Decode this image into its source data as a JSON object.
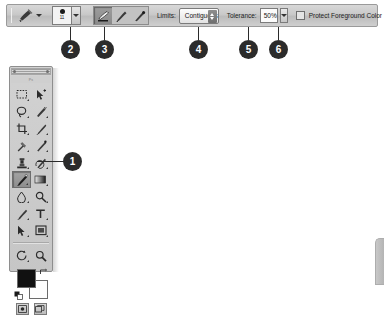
{
  "options_bar": {
    "tool_preset": {
      "icon": "brush-tool-icon",
      "dropdown": "chevron-down-icon"
    },
    "brush": {
      "size_label": "11",
      "icon": "brush-tip-preview-icon",
      "popup": "chevron-down-icon"
    },
    "sampling_modes": [
      {
        "name": "sampling-continuous",
        "icon": "sampling-continuous-icon",
        "selected": true
      },
      {
        "name": "sampling-once",
        "icon": "sampling-once-icon",
        "selected": false
      },
      {
        "name": "sampling-background-swatch",
        "icon": "sampling-background-swatch-icon",
        "selected": false
      }
    ],
    "limits": {
      "label": "Limits:",
      "value": "Contiguous"
    },
    "tolerance": {
      "label": "Tolerance:",
      "value": "50%"
    },
    "protect_foreground": {
      "label": "Protect Foreground Color",
      "checked": false
    },
    "end_icon": "brush-preset-icon"
  },
  "toolbox": {
    "title": "",
    "logo_text": "Ps",
    "tools": [
      {
        "name": "rectangular-marquee-tool",
        "icon": "marquee-icon",
        "has_flyout": true,
        "selected": false
      },
      {
        "name": "move-tool",
        "icon": "move-arrow-icon",
        "has_flyout": false,
        "selected": false
      },
      {
        "name": "lasso-tool",
        "icon": "lasso-icon",
        "has_flyout": true,
        "selected": false
      },
      {
        "name": "quick-selection-tool",
        "icon": "quick-selection-icon",
        "has_flyout": true,
        "selected": false
      },
      {
        "name": "crop-tool",
        "icon": "crop-icon",
        "has_flyout": true,
        "selected": false
      },
      {
        "name": "slice-tool",
        "icon": "slice-knife-icon",
        "has_flyout": true,
        "selected": false
      },
      {
        "name": "eyedropper-tool",
        "icon": "eyedropper-icon",
        "has_flyout": true,
        "selected": false
      },
      {
        "name": "healing-brush-tool",
        "icon": "healing-brush-icon",
        "has_flyout": true,
        "selected": false
      },
      {
        "name": "clone-stamp-tool",
        "icon": "clone-stamp-icon",
        "has_flyout": true,
        "selected": false
      },
      {
        "name": "history-brush-tool",
        "icon": "history-brush-icon",
        "has_flyout": true,
        "selected": false
      },
      {
        "name": "background-eraser-tool",
        "icon": "background-eraser-icon",
        "has_flyout": true,
        "selected": true
      },
      {
        "name": "gradient-tool",
        "icon": "gradient-icon",
        "has_flyout": true,
        "selected": false
      },
      {
        "name": "blur-tool",
        "icon": "blur-droplet-icon",
        "has_flyout": true,
        "selected": false
      },
      {
        "name": "dodge-tool",
        "icon": "dodge-icon",
        "has_flyout": true,
        "selected": false
      },
      {
        "name": "pen-tool",
        "icon": "pen-icon",
        "has_flyout": true,
        "selected": false
      },
      {
        "name": "horizontal-type-tool",
        "icon": "type-t-icon",
        "has_flyout": true,
        "selected": false
      },
      {
        "name": "path-selection-tool",
        "icon": "path-arrow-icon",
        "has_flyout": true,
        "selected": false
      },
      {
        "name": "rectangle-shape-tool",
        "icon": "rectangle-shape-icon",
        "has_flyout": true,
        "selected": false
      },
      {
        "name": "rotate-view-tool",
        "icon": "rotate-view-icon",
        "has_flyout": true,
        "selected": false
      },
      {
        "name": "zoom-tool",
        "icon": "magnifier-icon",
        "has_flyout": false,
        "selected": false
      }
    ],
    "colors": {
      "foreground": "#111111",
      "background": "#fdfdfd",
      "swap_icon": "swap-colors-icon",
      "default_icon": "default-colors-icon"
    },
    "screen_modes": [
      {
        "name": "edit-in-quick-mask-mode",
        "icon": "quick-mask-icon"
      },
      {
        "name": "change-screen-mode",
        "icon": "screen-mode-icon"
      }
    ]
  },
  "callouts": [
    {
      "number": "1",
      "target": "background-eraser-tool"
    },
    {
      "number": "2",
      "target": "brush-size-picker"
    },
    {
      "number": "3",
      "target": "sampling-mode-group"
    },
    {
      "number": "4",
      "target": "limits-select"
    },
    {
      "number": "5",
      "target": "tolerance-input"
    },
    {
      "number": "6",
      "target": "protect-foreground-checkbox"
    }
  ],
  "theme": {
    "callout_fill": "#2b2b2b",
    "callout_text": "#ffffff",
    "bar_background": "#c9c9c9",
    "panel_background": "#cccccc"
  }
}
